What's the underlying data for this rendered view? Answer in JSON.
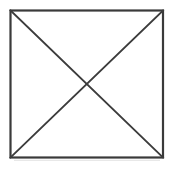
{
  "figure": {
    "title": "Square with both diagonals",
    "description": "A square outline containing two diagonal lines connecting opposite corners, forming an X inside the square.",
    "canvas": {
      "width": 173,
      "height": 170,
      "background_color": "#ffffff"
    },
    "style": {
      "stroke_color": "#3a3a3a",
      "stroke_color_diagonal": "#3c3c3c",
      "stroke_width_border": 2.2,
      "stroke_width_diagonal": 1.9,
      "fill_color": "#ffffff",
      "shadow_color": "#e8e8e8"
    },
    "square": {
      "name": "square-outline",
      "left": 10.5,
      "top": 10.5,
      "right": 163,
      "bottom": 157.5,
      "width": 152.5,
      "height": 147,
      "corners": {
        "top_left": [
          10.5,
          10.5
        ],
        "top_right": [
          163,
          10.5
        ],
        "bottom_right": [
          163,
          157.5
        ],
        "bottom_left": [
          10.5,
          157.5
        ]
      }
    },
    "diagonals": [
      {
        "name": "diagonal-top-left-to-bottom-right",
        "from": [
          10.5,
          10.5
        ],
        "to": [
          163,
          157.5
        ]
      },
      {
        "name": "diagonal-top-right-to-bottom-left",
        "from": [
          163,
          10.5
        ],
        "to": [
          10.5,
          157.5
        ]
      }
    ],
    "intersection": {
      "name": "diagonal-intersection-center",
      "point": [
        86.75,
        84
      ]
    }
  }
}
